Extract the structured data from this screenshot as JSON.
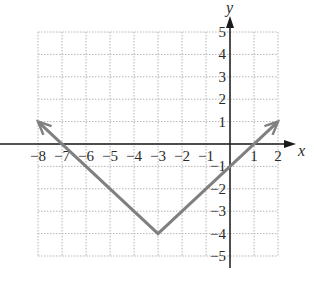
{
  "chart_data": {
    "type": "line",
    "title": "",
    "xlabel": "x",
    "ylabel": "y",
    "xlim": [
      -8,
      2
    ],
    "ylim": [
      -5,
      5
    ],
    "grid": true,
    "x_ticks": [
      -8,
      -7,
      -6,
      -5,
      -4,
      -3,
      -2,
      -1,
      1,
      2
    ],
    "x_tick_labels": [
      "−8",
      "−7",
      "−6",
      "−5",
      "−4",
      "−3",
      "−2",
      "−1",
      "1",
      "2"
    ],
    "y_ticks": [
      5,
      4,
      3,
      2,
      1,
      -1,
      -2,
      -3,
      -4,
      -5
    ],
    "y_tick_labels": [
      "5",
      "4",
      "3",
      "2",
      "1",
      "−1",
      "−2",
      "−3",
      "−4",
      "−5"
    ],
    "series": [
      {
        "name": "y = |x + 3| − 4",
        "points": [
          [
            -8,
            1
          ],
          [
            -3,
            -4
          ],
          [
            2,
            1
          ]
        ],
        "arrows_at_ends": true,
        "color": "#808080"
      }
    ],
    "key_points": {
      "vertex": [
        -3,
        -4
      ],
      "x_intercepts": [
        -7,
        1
      ],
      "y_intercept": -1
    }
  },
  "colors": {
    "grid": "#b5b5b5",
    "axes": "#1a1a1a",
    "graph": "#808080",
    "text": "#2a2a2a"
  }
}
